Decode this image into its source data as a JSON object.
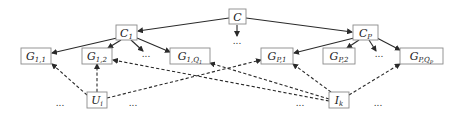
{
  "diagram": {
    "type": "hierarchy-graph",
    "nodes": [
      {
        "id": "C",
        "label": "C",
        "sub": "",
        "subsub": "",
        "style": "calligraphic",
        "x": 229,
        "y": 9,
        "w": 17,
        "h": 15
      },
      {
        "id": "C1",
        "label": "C",
        "sub": "1",
        "subsub": "",
        "x": 116,
        "y": 25,
        "w": 21,
        "h": 15
      },
      {
        "id": "CP",
        "label": "C",
        "sub": "P",
        "subsub": "",
        "x": 353,
        "y": 25,
        "w": 25,
        "h": 15
      },
      {
        "id": "G11",
        "label": "G",
        "sub": "1,1",
        "subsub": "",
        "x": 21,
        "y": 48,
        "w": 30,
        "h": 16
      },
      {
        "id": "G12",
        "label": "G",
        "sub": "1,2",
        "subsub": "",
        "x": 82,
        "y": 48,
        "w": 30,
        "h": 16
      },
      {
        "id": "G1Q1",
        "label": "G",
        "sub": "1,Q",
        "subsub": "1",
        "x": 170,
        "y": 48,
        "w": 40,
        "h": 16
      },
      {
        "id": "GP1",
        "label": "G",
        "sub": "P,1",
        "subsub": "",
        "x": 261,
        "y": 48,
        "w": 32,
        "h": 16
      },
      {
        "id": "GP2",
        "label": "G",
        "sub": "P,2",
        "subsub": "",
        "x": 323,
        "y": 48,
        "w": 32,
        "h": 16
      },
      {
        "id": "GPQP",
        "label": "G",
        "sub": "P,Q",
        "subsub": "P",
        "x": 400,
        "y": 48,
        "w": 43,
        "h": 16
      },
      {
        "id": "Ui",
        "label": "U",
        "sub": "i",
        "subsub": "",
        "x": 87,
        "y": 92,
        "w": 20,
        "h": 16
      },
      {
        "id": "Ik",
        "label": "I",
        "sub": "k",
        "subsub": "",
        "x": 329,
        "y": 92,
        "w": 20,
        "h": 16
      }
    ],
    "ellipses": [
      {
        "text": "...",
        "x": 237,
        "y": 44
      },
      {
        "text": "...",
        "x": 146,
        "y": 57
      },
      {
        "text": "...",
        "x": 379,
        "y": 57
      },
      {
        "text": "...",
        "x": 60,
        "y": 106
      },
      {
        "text": "...",
        "x": 133,
        "y": 106
      },
      {
        "text": "...",
        "x": 300,
        "y": 106
      },
      {
        "text": "...",
        "x": 378,
        "y": 106
      }
    ],
    "solid_edges": [
      {
        "from": "C",
        "to": "C1",
        "x1": 229,
        "y1": 18,
        "x2": 138,
        "y2": 31
      },
      {
        "from": "C",
        "to": "CP",
        "x1": 246,
        "y1": 18,
        "x2": 352,
        "y2": 32
      },
      {
        "from": "C",
        "to": "...",
        "x1": 237,
        "y1": 25,
        "x2": 237,
        "y2": 36
      },
      {
        "from": "C1",
        "to": "G11",
        "x1": 117,
        "y1": 38,
        "x2": 52,
        "y2": 53
      },
      {
        "from": "C1",
        "to": "G12",
        "x1": 121,
        "y1": 40,
        "x2": 108,
        "y2": 48
      },
      {
        "from": "C1",
        "to": "...",
        "x1": 131,
        "y1": 40,
        "x2": 143,
        "y2": 51
      },
      {
        "from": "C1",
        "to": "G1Q1",
        "x1": 137,
        "y1": 38,
        "x2": 170,
        "y2": 52
      },
      {
        "from": "CP",
        "to": "GP1",
        "x1": 354,
        "y1": 38,
        "x2": 294,
        "y2": 53
      },
      {
        "from": "CP",
        "to": "GP2",
        "x1": 359,
        "y1": 40,
        "x2": 347,
        "y2": 48
      },
      {
        "from": "CP",
        "to": "...",
        "x1": 369,
        "y1": 40,
        "x2": 376,
        "y2": 51
      },
      {
        "from": "CP",
        "to": "GPQP",
        "x1": 377,
        "y1": 38,
        "x2": 400,
        "y2": 50
      }
    ],
    "dashed_edges": [
      {
        "from": "Ui",
        "to": "G11",
        "x1": 87,
        "y1": 95,
        "x2": 52,
        "y2": 64
      },
      {
        "from": "Ui",
        "to": "G12",
        "x1": 97,
        "y1": 92,
        "x2": 97,
        "y2": 64
      },
      {
        "from": "Ui",
        "to": "GP1",
        "x1": 107,
        "y1": 98,
        "x2": 261,
        "y2": 60
      },
      {
        "from": "Ik",
        "to": "G12",
        "x1": 329,
        "y1": 101,
        "x2": 113,
        "y2": 60
      },
      {
        "from": "Ik",
        "to": "G1Q1",
        "x1": 329,
        "y1": 99,
        "x2": 210,
        "y2": 63
      },
      {
        "from": "Ik",
        "to": "GP1",
        "x1": 331,
        "y1": 92,
        "x2": 293,
        "y2": 64
      },
      {
        "from": "Ik",
        "to": "GPQP",
        "x1": 349,
        "y1": 95,
        "x2": 400,
        "y2": 64
      }
    ]
  }
}
